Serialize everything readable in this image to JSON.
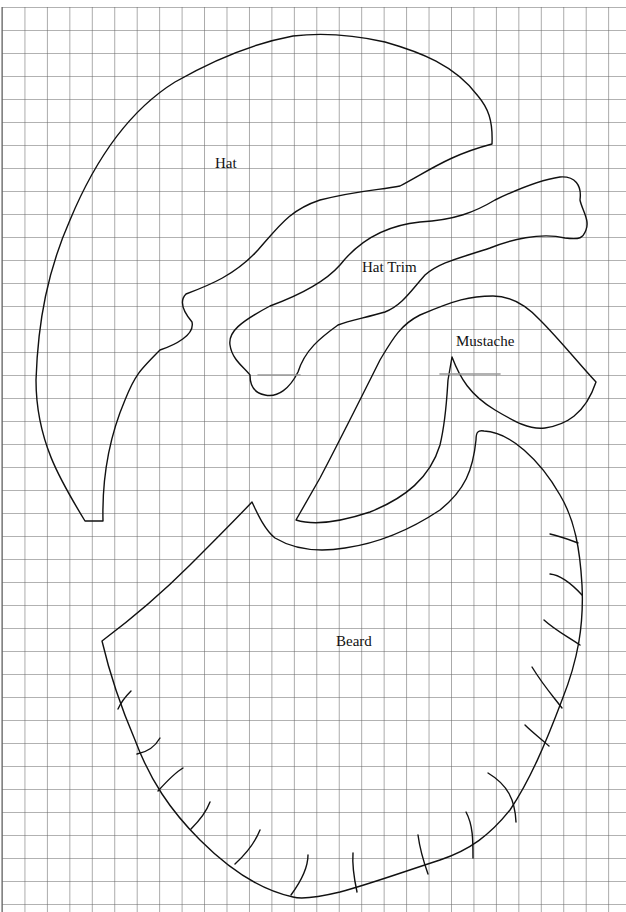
{
  "pattern": {
    "pieces": [
      {
        "id": "hat",
        "label": "Hat",
        "label_pos": [
          215,
          158
        ]
      },
      {
        "id": "hat-trim",
        "label": "Hat Trim",
        "label_pos": [
          362,
          262
        ]
      },
      {
        "id": "mustache",
        "label": "Mustache",
        "label_pos": [
          456,
          336
        ]
      },
      {
        "id": "beard",
        "label": "Beard",
        "label_pos": [
          336,
          635
        ]
      }
    ]
  },
  "grid": {
    "origin_x": 2,
    "origin_y": 7,
    "cell_w": 22.45,
    "cell_h": 23,
    "line_color": "#555555"
  },
  "colors": {
    "stroke": "#111111",
    "background": "#ffffff"
  }
}
